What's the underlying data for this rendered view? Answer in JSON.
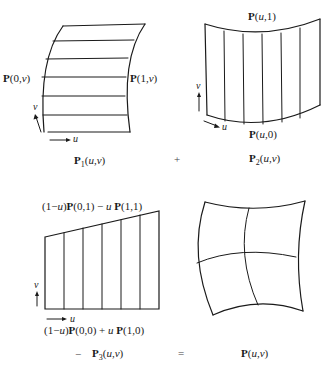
{
  "panels": {
    "p1": {
      "left_label": "P(0,v)",
      "right_label": "P(1,v)",
      "caption": "P1(u,v)",
      "caption_parts": {
        "bold": "P",
        "sub": "1",
        "rest": "(u,v)"
      },
      "axis_u": "u",
      "axis_v": "v"
    },
    "p2": {
      "top_label": "P(u,1)",
      "bottom_label": "P(u,0)",
      "caption": "P2(u,v)",
      "caption_parts": {
        "bold": "P",
        "sub": "2",
        "rest": "(u,v)"
      },
      "axis_u": "u",
      "axis_v": "v"
    },
    "p3": {
      "top_label": "(1−u)P(0,1) − u P(1,1)",
      "bottom_label": "(1−u)P(0,0) + u P(1,0)",
      "caption": "P3(u,v)",
      "caption_parts": {
        "bold": "P",
        "sub": "3",
        "rest": "(u,v)"
      },
      "axis_u": "u",
      "axis_v": "v"
    },
    "p": {
      "caption": "P(u,v)",
      "caption_parts": {
        "bold": "P",
        "rest": "(u,v)"
      }
    }
  },
  "operators": {
    "plus": "+",
    "minus": "−",
    "equals": "="
  },
  "colors": {
    "stroke": "#1a1a1a",
    "background": "#ffffff"
  }
}
